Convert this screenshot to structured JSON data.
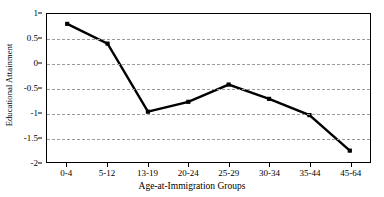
{
  "chart_data": {
    "type": "line",
    "title": "",
    "xlabel": "Age-at-Immigration Groups",
    "ylabel": "Educational Attainment",
    "categories": [
      "0-4",
      "5-12",
      "13-19",
      "20-24",
      "25-29",
      "30-34",
      "35-44",
      "45-64"
    ],
    "values": [
      0.8,
      0.4,
      -0.98,
      -0.78,
      -0.43,
      -0.72,
      -1.05,
      -1.77
    ],
    "series": [
      {
        "name": "Educational Attainment",
        "values": [
          0.8,
          0.4,
          -0.98,
          -0.78,
          -0.43,
          -0.72,
          -1.05,
          -1.77
        ]
      }
    ],
    "ylim": [
      -2,
      1
    ],
    "ytick_labels": [
      "1",
      "0.5",
      "0",
      "-0.5",
      "-1",
      "-1.5",
      "-2"
    ],
    "ytick_values": [
      1,
      0.5,
      0,
      -0.5,
      -1,
      -1.5,
      -2
    ],
    "grid": "horizontal-dashed",
    "legend": "none",
    "line_color": "#000000",
    "marker": "square",
    "marker_color": "#000000",
    "grid_color": "#9a9a9a",
    "background_color": "#ffffff"
  }
}
